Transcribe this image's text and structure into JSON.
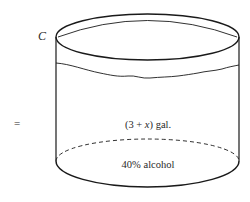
{
  "diagram": {
    "type": "cylinder-container",
    "container_label": "C",
    "left_operator": "=",
    "volume_label": {
      "prefix": "(3 + ",
      "variable": "x",
      "suffix": ") gal."
    },
    "concentration_label": "40% alcohol",
    "colors": {
      "stroke": "#1a1a1a",
      "background": "#ffffff",
      "text": "#2a2a2a"
    }
  }
}
